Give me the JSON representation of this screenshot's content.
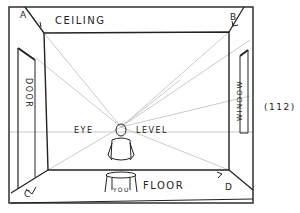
{
  "figure": {
    "number": "(112)",
    "labels": {
      "ceiling": "CEILING",
      "floor": "FLOOR",
      "eye": "EYE",
      "level": "LEVEL",
      "you": "YOU",
      "door": "DOOR",
      "window": "WINDOW"
    },
    "corners": {
      "a": "A",
      "b": "B",
      "c": "C",
      "d": "D"
    },
    "colors": {
      "ink": "#222222",
      "sight_lines": "#b8b8b8",
      "background": "#ffffff"
    }
  }
}
